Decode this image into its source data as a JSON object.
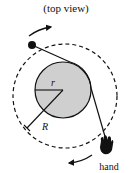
{
  "diagram": {
    "title": "(top view)",
    "labels": {
      "inner_radius": "r",
      "outer_radius": "R",
      "hand": "hand"
    },
    "colors": {
      "ink": "#111111",
      "inner_disk_fill": "#cfcfcf",
      "background": "#ffffff"
    },
    "elements": [
      "dashed outer circular path of radius R",
      "gray inner disk of radius r",
      "ball on string",
      "string wrapping tangent around disk to hand",
      "hand icon",
      "rotation arrow (top, clockwise)",
      "rotation arrow (bottom, clockwise)"
    ]
  }
}
